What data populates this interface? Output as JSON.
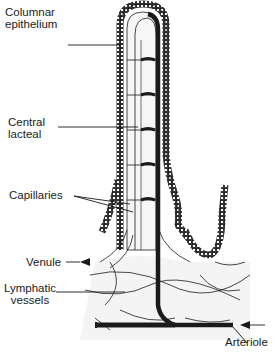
{
  "figure": {
    "labels": {
      "columnar_epithelium": [
        "Columnar",
        "epithelium"
      ],
      "central_lacteal": [
        "Central",
        "lacteal"
      ],
      "capillaries": "Capillaries",
      "venule": "Venule",
      "lymphatic_vessels": [
        "Lymphatic",
        "vessels"
      ],
      "arteriole": "Arteriole"
    },
    "colors": {
      "ink": "#1a1a1a",
      "background": "#ffffff",
      "tissue_fill": "#efefef"
    }
  }
}
